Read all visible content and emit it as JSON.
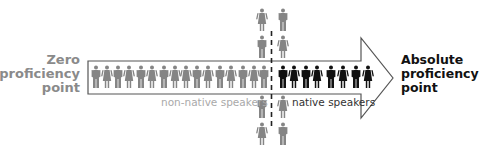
{
  "diagram": {
    "left_label": [
      "Zero",
      "proficiency",
      "point"
    ],
    "right_label": [
      "Absolute",
      "proficiency",
      "point"
    ],
    "captions": {
      "non_native": "non-native speakers",
      "native": "native speakers"
    },
    "colors": {
      "non_native_figure": "#858585",
      "native_figure": "#111111",
      "arrow_outline": "#555555",
      "divider": "#222222",
      "left_label": "#8a8a8a",
      "right_label": "#111111"
    },
    "row_figures": {
      "non_native_count": 16,
      "native_count": 8
    },
    "column_figures_above": 4,
    "column_figures_below": 4
  }
}
